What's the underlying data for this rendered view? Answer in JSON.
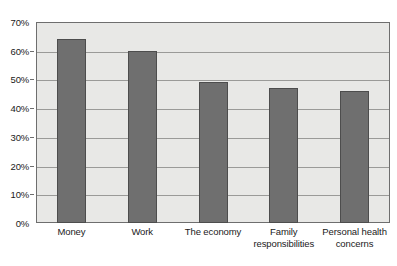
{
  "chart_data": {
    "type": "bar",
    "title": "",
    "subtitle": "",
    "xlabel": "",
    "ylabel": "",
    "categories": [
      "Money",
      "Work",
      "The economy",
      "Family responsibilities",
      "Personal health concerns"
    ],
    "values": [
      64,
      60,
      49,
      47,
      46
    ],
    "value_labels": [
      "64%",
      "60%",
      "49%",
      "47%",
      "46%"
    ],
    "ylim": [
      0,
      70
    ],
    "ytick_values": [
      0,
      10,
      20,
      30,
      40,
      50,
      60,
      70
    ],
    "ytick_labels": [
      "0%",
      "10%",
      "20%",
      "30%",
      "40%",
      "50%",
      "60%",
      "70%"
    ],
    "grid": true,
    "grid_axis": "y",
    "legend": false,
    "legend_position": "none",
    "colors": {
      "bar_fill": "#6f6f6f",
      "bar_edge": "#4d4d4d",
      "plot_background": "#e8e8e6",
      "gridline": "#9a9a98",
      "axis_border": "#6e6e6e",
      "text": "#1a1a1a",
      "figure_background": "#ffffff"
    }
  }
}
